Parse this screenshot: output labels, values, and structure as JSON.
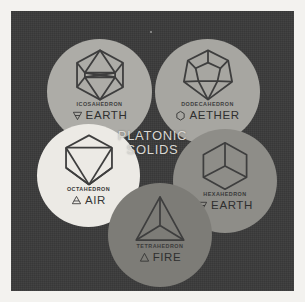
{
  "poster": {
    "title_line_1": "PLATONIC",
    "title_line_2": "SOLIDS",
    "background_color": "#3a3a3a",
    "mat_color": "#f3f2ef",
    "ink_color": "#3e3e3e"
  },
  "nodes": [
    {
      "id": "icosahedron",
      "solid_name": "ICOSAHEDRON",
      "element": "EARTH",
      "element_symbol": "earth-alchemical-symbol",
      "circle_color": "#adaca7",
      "faces": 20
    },
    {
      "id": "dodecahedron",
      "solid_name": "DODECAHEDRON",
      "element": "AETHER",
      "element_symbol": "aether-alchemical-symbol",
      "circle_color": "#a7a6a1",
      "faces": 12
    },
    {
      "id": "octahedron",
      "solid_name": "OCTAHEDRON",
      "element": "AIR",
      "element_symbol": "air-alchemical-symbol",
      "circle_color": "#eceae5",
      "faces": 8
    },
    {
      "id": "hexahedron",
      "solid_name": "HEXAHEDRON",
      "element": "EARTH",
      "element_symbol": "earth-alchemical-symbol",
      "circle_color": "#8e8d88",
      "faces": 6
    },
    {
      "id": "tetrahedron",
      "solid_name": "TETRAHEDRON",
      "element": "FIRE",
      "element_symbol": "fire-alchemical-symbol",
      "circle_color": "#7d7c77",
      "faces": 4
    }
  ]
}
